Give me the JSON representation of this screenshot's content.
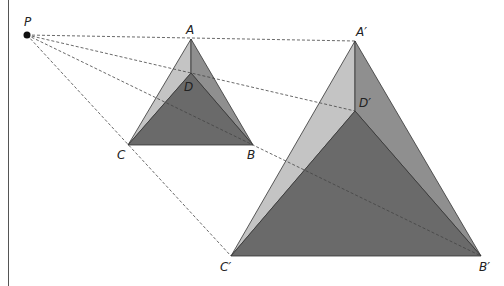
{
  "diagram": {
    "center": {
      "label": "P",
      "x": 27,
      "y": 35
    },
    "original": {
      "vertices": {
        "A": {
          "label": "A",
          "x": 191,
          "y": 39
        },
        "D": {
          "label": "D",
          "x": 191,
          "y": 73
        },
        "C": {
          "label": "C",
          "x": 128,
          "y": 145
        },
        "B": {
          "label": "B",
          "x": 253,
          "y": 145
        }
      }
    },
    "image": {
      "vertices": {
        "A": {
          "label": "A′",
          "x": 355,
          "y": 41
        },
        "D": {
          "label": "D′",
          "x": 355,
          "y": 111
        },
        "C": {
          "label": "C′",
          "x": 231,
          "y": 256
        },
        "B": {
          "label": "B′",
          "x": 481,
          "y": 256
        }
      }
    },
    "colors": {
      "left_face": "#c4c4c4",
      "right_face": "#8f8f8f",
      "front_face": "#6a6a6a",
      "edge": "#333333",
      "dashed": "#444444"
    }
  }
}
